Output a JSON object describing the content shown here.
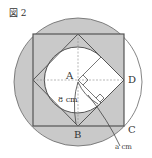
{
  "figure": {
    "title": "図 2",
    "labels": {
      "A": "A",
      "B": "B",
      "C": "C",
      "D": "D",
      "radius": "8 cm",
      "a": "a cm"
    },
    "colors": {
      "shade": "#c9c9c9",
      "line": "#555555",
      "dash": "#888888"
    }
  }
}
